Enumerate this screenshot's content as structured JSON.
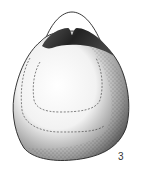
{
  "figure": {
    "label": "3",
    "colors": {
      "ink": "#1a1a1a",
      "background": "#ffffff"
    }
  }
}
